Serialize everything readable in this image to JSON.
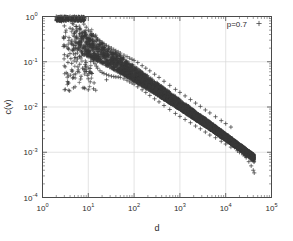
{
  "figure": {
    "background": "#ffffff",
    "frame_color": "#4a4a4a",
    "grid_color": "#d8d8d8",
    "marker_color": "#3a3a3a"
  },
  "legend": {
    "entries": [
      {
        "label": "p=0.7",
        "marker": "plus-marker",
        "color": "#3a3a3a"
      }
    ],
    "position": "top-right-inside"
  },
  "axes": {
    "x": {
      "label": "d",
      "scale": "log",
      "ticks": [
        {
          "mantissa": "10",
          "exponent": "0"
        },
        {
          "mantissa": "10",
          "exponent": "1"
        },
        {
          "mantissa": "10",
          "exponent": "2"
        },
        {
          "mantissa": "10",
          "exponent": "3"
        },
        {
          "mantissa": "10",
          "exponent": "4"
        },
        {
          "mantissa": "10",
          "exponent": "5"
        }
      ]
    },
    "y": {
      "label": "c(v)",
      "scale": "log",
      "ticks": [
        {
          "mantissa": "10",
          "exponent": "0"
        },
        {
          "mantissa": "10",
          "exponent": "-1"
        },
        {
          "mantissa": "10",
          "exponent": "-2"
        },
        {
          "mantissa": "10",
          "exponent": "-3"
        },
        {
          "mantissa": "10",
          "exponent": "-4"
        }
      ]
    }
  },
  "chart_data": {
    "type": "scatter",
    "title": "",
    "xlabel": "d",
    "ylabel": "c(v)",
    "xscale": "log",
    "yscale": "log",
    "xlim": [
      1,
      100000
    ],
    "ylim": [
      0.0001,
      1
    ],
    "grid": true,
    "legend_position": "top-right",
    "marker": "+",
    "series": [
      {
        "name": "p=0.7",
        "color": "#3a3a3a",
        "description": "Dense wedge-shaped cloud of plus markers: clustering coefficient c(v) versus degree/distance d on log-log axes. Saturates near c=1 for small d (d=2 to 10), then decays as an approximate power law with slope about -0.75, narrowing to a sparse tail near d=4e4, c=3.5e-4.",
        "power_law_slope": -0.75,
        "points": [
          [
            2.0,
            1.0
          ],
          [
            2.4,
            0.92
          ],
          [
            2.6,
            0.78
          ],
          [
            3.0,
            1.0
          ],
          [
            3.0,
            0.62
          ],
          [
            3.2,
            0.45
          ],
          [
            3.5,
            0.85
          ],
          [
            3.8,
            0.34
          ],
          [
            4.0,
            1.0
          ],
          [
            4.0,
            0.55
          ],
          [
            4.2,
            0.26
          ],
          [
            4.5,
            0.7
          ],
          [
            4.8,
            0.19
          ],
          [
            5.0,
            1.0
          ],
          [
            5.0,
            0.42
          ],
          [
            5.2,
            0.15
          ],
          [
            5.5,
            0.6
          ],
          [
            5.8,
            0.115
          ],
          [
            6.0,
            0.95
          ],
          [
            6.0,
            0.33
          ],
          [
            6.5,
            0.52
          ],
          [
            6.5,
            0.088
          ],
          [
            7.0,
            0.8
          ],
          [
            7.0,
            0.27
          ],
          [
            7.5,
            0.44
          ],
          [
            7.5,
            0.072
          ],
          [
            8.0,
            0.68
          ],
          [
            8.0,
            0.22
          ],
          [
            8.5,
            0.38
          ],
          [
            8.5,
            0.06
          ],
          [
            9.0,
            0.58
          ],
          [
            9.0,
            0.185
          ],
          [
            9.5,
            0.33
          ],
          [
            9.5,
            0.05
          ],
          [
            10.0,
            0.5
          ],
          [
            10.0,
            0.155
          ],
          [
            10.0,
            0.042
          ],
          [
            10.0,
            0.024
          ],
          [
            11.0,
            0.46
          ],
          [
            11.0,
            0.13
          ],
          [
            11.0,
            0.036
          ],
          [
            12.0,
            0.42
          ],
          [
            12.0,
            0.115
          ],
          [
            12.0,
            0.055
          ],
          [
            13.0,
            0.39
          ],
          [
            13.0,
            0.1
          ],
          [
            14.0,
            0.36
          ],
          [
            14.0,
            0.09
          ],
          [
            15.0,
            0.34
          ],
          [
            15.0,
            0.08
          ],
          [
            16.0,
            0.32
          ],
          [
            16.0,
            0.072
          ],
          [
            18.0,
            0.29
          ],
          [
            18.0,
            0.063
          ],
          [
            20.0,
            0.27
          ],
          [
            20.0,
            0.058
          ],
          [
            22.0,
            0.25
          ],
          [
            22.0,
            0.055
          ],
          [
            25.0,
            0.23
          ],
          [
            25.0,
            0.052
          ],
          [
            25.0,
            0.04
          ],
          [
            28.0,
            0.215
          ],
          [
            28.0,
            0.05
          ],
          [
            32.0,
            0.2
          ],
          [
            32.0,
            0.048
          ],
          [
            36.0,
            0.185
          ],
          [
            36.0,
            0.047
          ],
          [
            40.0,
            0.175
          ],
          [
            40.0,
            0.046
          ],
          [
            45.0,
            0.165
          ],
          [
            45.0,
            0.046
          ],
          [
            50.0,
            0.155
          ],
          [
            50.0,
            0.045
          ],
          [
            60.0,
            0.14
          ],
          [
            60.0,
            0.042
          ],
          [
            70.0,
            0.13
          ],
          [
            70.0,
            0.039
          ],
          [
            80.0,
            0.12
          ],
          [
            80.0,
            0.036
          ],
          [
            90.0,
            0.113
          ],
          [
            90.0,
            0.034
          ],
          [
            100.0,
            0.107
          ],
          [
            100.0,
            0.032
          ],
          [
            120.0,
            0.096
          ],
          [
            120.0,
            0.028
          ],
          [
            150.0,
            0.082
          ],
          [
            150.0,
            0.024
          ],
          [
            180.0,
            0.072
          ],
          [
            180.0,
            0.021
          ],
          [
            220.0,
            0.063
          ],
          [
            220.0,
            0.018
          ],
          [
            280.0,
            0.053
          ],
          [
            280.0,
            0.0152
          ],
          [
            350.0,
            0.045
          ],
          [
            350.0,
            0.013
          ],
          [
            450.0,
            0.037
          ],
          [
            450.0,
            0.0108
          ],
          [
            600.0,
            0.03
          ],
          [
            600.0,
            0.0088
          ],
          [
            800.0,
            0.0245
          ],
          [
            800.0,
            0.0072
          ],
          [
            1000.0,
            0.021
          ],
          [
            1000.0,
            0.0062
          ],
          [
            1300.0,
            0.0176
          ],
          [
            1300.0,
            0.0053
          ],
          [
            1700.0,
            0.0146
          ],
          [
            1700.0,
            0.0045
          ],
          [
            2200.0,
            0.0122
          ],
          [
            2200.0,
            0.0038
          ],
          [
            2800.0,
            0.0103
          ],
          [
            2800.0,
            0.0033
          ],
          [
            3600.0,
            0.0086
          ],
          [
            3600.0,
            0.0028
          ],
          [
            4500.0,
            0.0074
          ],
          [
            4500.0,
            0.0024
          ],
          [
            6000.0,
            0.0061
          ],
          [
            6000.0,
            0.0021
          ],
          [
            8000.0,
            0.005
          ],
          [
            8000.0,
            0.00175
          ],
          [
            10000.0,
            0.0043
          ],
          [
            10000.0,
            0.00152
          ],
          [
            13000.0,
            0.0036
          ],
          [
            13000.0,
            0.0013
          ],
          [
            16000.0,
            0.00145
          ],
          [
            18000.0,
            0.00108
          ],
          [
            20000.0,
            0.001
          ],
          [
            24000.0,
            0.00088
          ],
          [
            28000.0,
            0.00076
          ],
          [
            32000.0,
            0.00062
          ],
          [
            36000.0,
            0.0005
          ],
          [
            40000.0,
            0.0004
          ],
          [
            42000.0,
            0.00035
          ]
        ]
      }
    ]
  }
}
